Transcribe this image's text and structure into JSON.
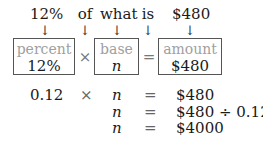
{
  "top_row": {
    "words": [
      {
        "text": "12%",
        "x": 30,
        "w": 30
      },
      {
        "text": "of",
        "x": 76,
        "w": 18
      },
      {
        "text": "what",
        "x": 100,
        "w": 34
      },
      {
        "text": "is",
        "x": 140,
        "w": 16
      },
      {
        "text": "$480",
        "x": 172,
        "w": 36
      }
    ],
    "arrow_glyph": "↓"
  },
  "boxes": [
    {
      "label": "percent",
      "value": "12%",
      "value_italic": false
    },
    {
      "label": "base",
      "value": "n",
      "value_italic": true
    },
    {
      "label": "amount",
      "value": "$480",
      "value_italic": false
    }
  ],
  "operators": {
    "times": "×",
    "equals": "="
  },
  "equations": [
    {
      "left": "0.12",
      "op1": "×",
      "var": "n",
      "eq": "=",
      "right": "$480"
    },
    {
      "left": "",
      "op1": "",
      "var": "n",
      "eq": "=",
      "right": "$480 ÷ 0.12"
    },
    {
      "left": "",
      "op1": "",
      "var": "n",
      "eq": "=",
      "right": "$4000"
    }
  ],
  "colors": {
    "box_border": "#555555",
    "label_gray": "#a0a0a0",
    "text": "#1a1a1a"
  }
}
